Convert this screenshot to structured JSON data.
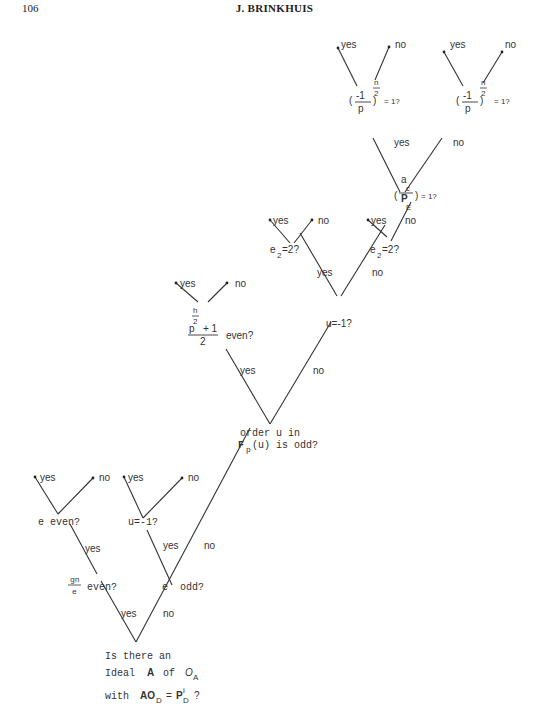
{
  "header": {
    "page_number": "106",
    "running_head": "J. BRINKHUIS"
  },
  "tree": {
    "root": {
      "lines": [
        "Is there an",
        "Ideal",
        "A",
        "of",
        "O",
        "A",
        "with",
        "AO",
        "D",
        "=",
        "P",
        "i",
        "D",
        "?"
      ]
    },
    "edge_labels": {
      "yes": "yes",
      "no": "no"
    },
    "nodes": {
      "gn_e_even": {
        "num": "gn",
        "den": "e",
        "text": "even?"
      },
      "e_even": {
        "text": "e even?"
      },
      "e_odd": {
        "pre": "e",
        "text": "odd?"
      },
      "u_eq_m1_left": {
        "text": "u=-1?"
      },
      "order_u": {
        "line1": "order u in",
        "line2_pre": "F",
        "line2_sub": "p",
        "line2_post": "(u) is odd?"
      },
      "p_h2": {
        "base": "p",
        "exp_num": "h",
        "exp_den": "2",
        "plus": "+ 1",
        "den": "2",
        "text": "even?"
      },
      "u_eq_m1_right": {
        "text": "u=-1?"
      },
      "e2_left": {
        "base": "e",
        "sub": "2",
        "text": "=2?"
      },
      "e2_right": {
        "base": "e",
        "sub": "2",
        "text": "=2?"
      },
      "a_c_PE": {
        "num": "a",
        "sup": "c",
        "den": "P",
        "sub": "E",
        "text": "= 1?"
      },
      "legendre_left": {
        "num": "-1",
        "den": "p",
        "exp_num": "n",
        "exp_den": "2",
        "text": "= 1?"
      },
      "legendre_right": {
        "num": "-1",
        "den": "p",
        "exp_num": "n",
        "exp_den": "2",
        "text": "= 1?"
      }
    }
  }
}
